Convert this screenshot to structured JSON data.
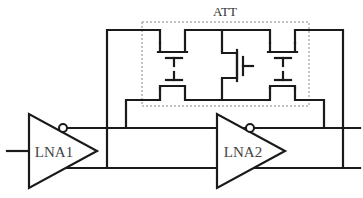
{
  "diagram": {
    "type": "circuit-schematic",
    "attenuator": {
      "label": "ATT"
    },
    "amplifiers": [
      {
        "id": "lna1",
        "label": "LNA1"
      },
      {
        "id": "lna2",
        "label": "LNA2"
      }
    ],
    "colors": {
      "wire": "#1a1a1a",
      "dashed_box": "#8a8a8a",
      "text": "#444444"
    }
  }
}
